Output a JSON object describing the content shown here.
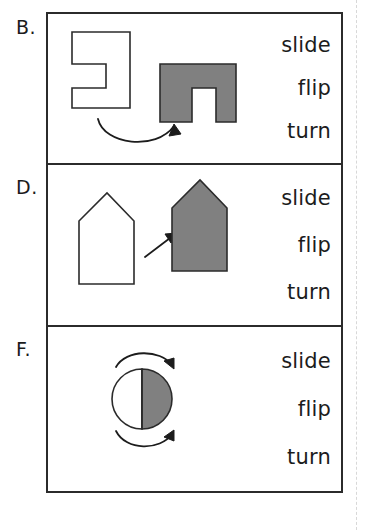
{
  "worksheet": {
    "title": "Slide, Flip, Turn transformation worksheet",
    "ink_color": "#1c1c1c",
    "shape_fill_gray": "#808080",
    "shape_fill_white": "#ffffff"
  },
  "panels": [
    {
      "letter": "B.",
      "figure_name": "notched-rectangle-turn",
      "transformation_shown": "turn",
      "arrow_type": "curved-rotation-arrow",
      "shapes": [
        {
          "name": "white-notched-rectangle",
          "fill": "#ffffff"
        },
        {
          "name": "gray-notched-rectangle-rotated",
          "fill": "#808080"
        }
      ],
      "choices": [
        "slide",
        "flip",
        "turn"
      ]
    },
    {
      "letter": "D.",
      "figure_name": "house-pentagon-slide",
      "transformation_shown": "slide",
      "arrow_type": "straight-diagonal-arrow",
      "shapes": [
        {
          "name": "white-house-pentagon",
          "fill": "#ffffff"
        },
        {
          "name": "gray-house-pentagon",
          "fill": "#808080"
        }
      ],
      "choices": [
        "slide",
        "flip",
        "turn"
      ]
    },
    {
      "letter": "F.",
      "figure_name": "half-shaded-circle-turn",
      "transformation_shown": "turn",
      "arrow_type": "curved-rotation-arrows-pair",
      "shapes": [
        {
          "name": "circle-white-left-half",
          "fill": "#ffffff"
        },
        {
          "name": "circle-gray-right-half",
          "fill": "#808080"
        }
      ],
      "choices": [
        "slide",
        "flip",
        "turn"
      ]
    }
  ]
}
